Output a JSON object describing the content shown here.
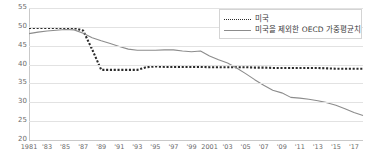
{
  "chart_data": {
    "type": "line",
    "title": "",
    "subtitle": "",
    "xlabel": "",
    "ylabel": "",
    "grid": true,
    "legend_position": "top-right",
    "xlim": [
      1981,
      2018
    ],
    "ylim": [
      20,
      55
    ],
    "yticks": [
      55,
      50,
      45,
      40,
      35,
      30,
      25,
      20
    ],
    "x": [
      1981,
      1982,
      1983,
      1984,
      1985,
      1986,
      1987,
      1988,
      1989,
      1990,
      1991,
      1992,
      1993,
      1994,
      1995,
      1996,
      1997,
      1998,
      1999,
      2000,
      2001,
      2002,
      2003,
      2004,
      2005,
      2006,
      2007,
      2008,
      2009,
      2010,
      2011,
      2012,
      2013,
      2014,
      2015,
      2016,
      2017,
      2018
    ],
    "xtick_labels": [
      {
        "value": 1981,
        "label": "1981"
      },
      {
        "value": 1983,
        "label": "'83"
      },
      {
        "value": 1985,
        "label": "'85"
      },
      {
        "value": 1987,
        "label": "'87"
      },
      {
        "value": 1989,
        "label": "'89"
      },
      {
        "value": 1991,
        "label": "'91"
      },
      {
        "value": 1993,
        "label": "'93"
      },
      {
        "value": 1995,
        "label": "'95"
      },
      {
        "value": 1997,
        "label": "'97"
      },
      {
        "value": 1999,
        "label": "'99"
      },
      {
        "value": 2001,
        "label": "2001"
      },
      {
        "value": 2003,
        "label": "'03"
      },
      {
        "value": 2005,
        "label": "'05"
      },
      {
        "value": 2007,
        "label": "'07"
      },
      {
        "value": 2009,
        "label": "'09"
      },
      {
        "value": 2011,
        "label": "'11"
      },
      {
        "value": 2013,
        "label": "'13"
      },
      {
        "value": 2015,
        "label": "'15"
      },
      {
        "value": 2017,
        "label": "'17"
      }
    ],
    "series": [
      {
        "name": "미국",
        "style": "dotted",
        "color": "#2b2b2b",
        "values": [
          49.7,
          49.7,
          49.7,
          49.7,
          49.7,
          49.7,
          49.0,
          44.0,
          38.6,
          38.6,
          38.6,
          38.6,
          38.6,
          39.3,
          39.5,
          39.4,
          39.4,
          39.4,
          39.4,
          39.4,
          39.3,
          39.3,
          39.3,
          39.3,
          39.3,
          39.2,
          39.2,
          39.1,
          39.1,
          39.1,
          39.1,
          39.1,
          39.1,
          39.0,
          38.9,
          38.9,
          38.9,
          38.9
        ]
      },
      {
        "name": "미국을 제외한 OECD 가중평균치",
        "style": "solid",
        "color": "#8c8c8c",
        "values": [
          48.2,
          48.6,
          48.9,
          49.1,
          49.3,
          49.2,
          48.3,
          47.1,
          46.3,
          45.6,
          44.8,
          44.1,
          43.8,
          43.8,
          43.8,
          43.9,
          43.9,
          43.6,
          43.4,
          43.6,
          42.3,
          41.3,
          40.4,
          39.1,
          37.6,
          36.0,
          34.5,
          33.2,
          32.5,
          31.3,
          31.1,
          30.8,
          30.4,
          29.9,
          29.2,
          28.3,
          27.3,
          26.5
        ]
      }
    ]
  },
  "legend": {
    "entries": [
      {
        "label": "미국",
        "style": "dotted"
      },
      {
        "label": "미국을 제외한 OECD 가중평균치",
        "style": "solid"
      }
    ]
  }
}
